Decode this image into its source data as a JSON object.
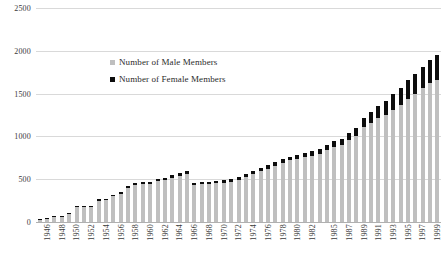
{
  "chart_data": {
    "type": "bar",
    "barmode": "stacked",
    "title": "",
    "xlabel": "",
    "ylabel": "",
    "ylim": [
      0,
      2500
    ],
    "yticks": [
      0,
      500,
      1000,
      1500,
      2000,
      2500
    ],
    "ytick_labels": [
      "0",
      "500",
      "1000",
      "1500",
      "2000",
      "2500"
    ],
    "grid": true,
    "legend_position": "inside-upper-left",
    "x": [
      1946,
      1947,
      1948,
      1949,
      1950,
      1951,
      1952,
      1953,
      1954,
      1955,
      1956,
      1957,
      1958,
      1959,
      1960,
      1961,
      1962,
      1963,
      1964,
      1965,
      1966,
      1967,
      1968,
      1969,
      1970,
      1971,
      1972,
      1973,
      1974,
      1975,
      1976,
      1977,
      1978,
      1979,
      1980,
      1981,
      1982,
      1983,
      1984,
      1985,
      1986,
      1987,
      1988,
      1989,
      1990,
      1991,
      1992,
      1993,
      1994,
      1995,
      1996,
      1997,
      1998,
      1999,
      2000
    ],
    "xtick_labels_shown": [
      "1946",
      "1948",
      "1950",
      "1952",
      "1954",
      "1956",
      "1958",
      "1960",
      "1962",
      "1964",
      "1966",
      "1968",
      "1970",
      "1972",
      "1974",
      "1976",
      "1978",
      "1980",
      "1982",
      "1985",
      "1987",
      "1989",
      "1991",
      "1993",
      "1995",
      "1997",
      "1999"
    ],
    "categories": [
      "1946",
      "1947",
      "1948",
      "1949",
      "1950",
      "1951",
      "1952",
      "1953",
      "1954",
      "1955",
      "1956",
      "1957",
      "1958",
      "1959",
      "1960",
      "1961",
      "1962",
      "1963",
      "1964",
      "1965",
      "1966",
      "1967",
      "1968",
      "1969",
      "1970",
      "1971",
      "1972",
      "1973",
      "1974",
      "1975",
      "1976",
      "1977",
      "1978",
      "1979",
      "1980",
      "1981",
      "1982",
      "1983",
      "1984",
      "1985",
      "1986",
      "1987",
      "1988",
      "1989",
      "1990",
      "1991",
      "1992",
      "1993",
      "1994",
      "1995",
      "1996",
      "1997",
      "1998",
      "1999",
      "2000"
    ],
    "series": [
      {
        "name": "Number of Male Members",
        "color": "#bfbfbf",
        "values": [
          22,
          30,
          55,
          58,
          95,
          175,
          175,
          175,
          250,
          255,
          300,
          330,
          400,
          430,
          440,
          440,
          480,
          490,
          520,
          540,
          560,
          435,
          440,
          445,
          450,
          460,
          470,
          495,
          530,
          560,
          600,
          625,
          660,
          690,
          720,
          740,
          755,
          775,
          800,
          840,
          880,
          905,
          960,
          1010,
          1110,
          1160,
          1210,
          1250,
          1310,
          1370,
          1440,
          1500,
          1560,
          1620,
          1660
        ]
      },
      {
        "name": "Number of Female Members",
        "color": "#0d0d0d",
        "values": [
          3,
          4,
          6,
          7,
          10,
          15,
          15,
          15,
          18,
          18,
          20,
          22,
          25,
          26,
          27,
          27,
          28,
          29,
          30,
          31,
          32,
          25,
          25,
          26,
          26,
          27,
          28,
          30,
          32,
          34,
          36,
          38,
          40,
          42,
          45,
          47,
          50,
          52,
          55,
          60,
          66,
          70,
          80,
          90,
          105,
          125,
          145,
          165,
          185,
          200,
          215,
          230,
          250,
          270,
          290
        ]
      }
    ]
  },
  "legend": {
    "items": [
      {
        "label": "Number of Male Members",
        "color": "#bfbfbf"
      },
      {
        "label": "Number of Female Members",
        "color": "#0d0d0d"
      }
    ]
  }
}
